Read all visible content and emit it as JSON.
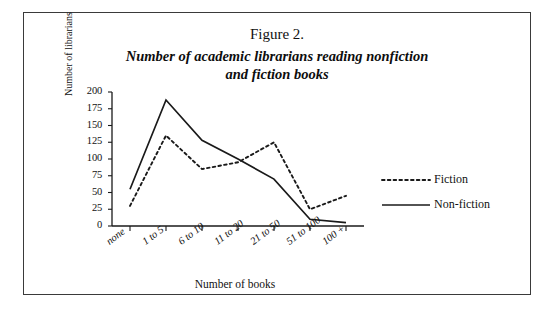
{
  "figure": {
    "number": "Figure 2.",
    "title_line1": "Number of academic librarians reading nonfiction",
    "title_line2": "and fiction books"
  },
  "chart_data": {
    "type": "line",
    "title": "Number of academic librarians reading nonfiction and fiction books",
    "xlabel": "Number of books",
    "ylabel": "Number of librarians",
    "categories": [
      "none",
      "1 to 5",
      "6 to 10",
      "11 to 20",
      "21 to 50",
      "51 to 100",
      "100 +"
    ],
    "yticks": [
      0,
      25,
      50,
      75,
      100,
      125,
      150,
      175,
      200
    ],
    "ylim": [
      0,
      200
    ],
    "grid": false,
    "legend_position": "right",
    "series": [
      {
        "name": "Fiction",
        "style": "dotted",
        "color": "#1a1a1a",
        "values": [
          30,
          135,
          85,
          95,
          125,
          25,
          45
        ]
      },
      {
        "name": "Non-fiction",
        "style": "solid",
        "color": "#1a1a1a",
        "values": [
          55,
          188,
          128,
          100,
          70,
          10,
          5
        ]
      }
    ]
  },
  "legend": {
    "fiction_label": "Fiction",
    "nonfiction_label": "Non-fiction"
  }
}
